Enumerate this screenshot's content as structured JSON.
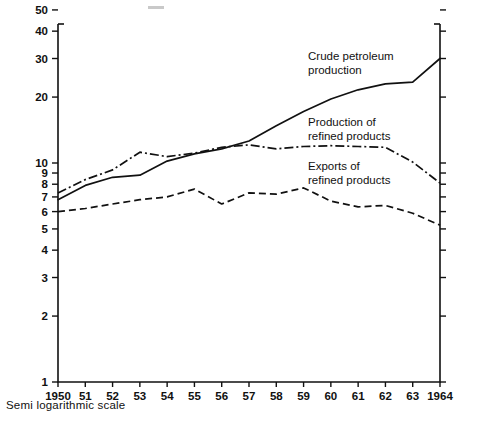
{
  "caption": "Semi logarithmic scale",
  "annotations": [
    {
      "id": "crude",
      "line1": "Crude petroleum",
      "line2": "production"
    },
    {
      "id": "production-refined",
      "line1": "Production of",
      "line2": "refined products"
    },
    {
      "id": "exports-refined",
      "line1": "Exports of",
      "line2": "refined products"
    }
  ],
  "axis": {
    "y_ticks": [
      "50",
      "40",
      "30",
      "20",
      "10",
      "9",
      "8",
      "7",
      "6",
      "5",
      "4",
      "3",
      "2",
      "1"
    ],
    "x_ticks": [
      "1950",
      "51",
      "52",
      "53",
      "54",
      "55",
      "56",
      "57",
      "58",
      "59",
      "60",
      "61",
      "62",
      "63",
      "1964"
    ],
    "scale": "log"
  },
  "chart_data": {
    "type": "line",
    "title": "",
    "subtitle": "",
    "xlabel": "",
    "ylabel": "",
    "yscale": "log",
    "ylim": [
      1,
      55
    ],
    "grid": false,
    "legend": "inline-annotations",
    "x": [
      1950,
      1951,
      1952,
      1953,
      1954,
      1955,
      1956,
      1957,
      1958,
      1959,
      1960,
      1961,
      1962,
      1963,
      1964
    ],
    "xticklabels": [
      "1950",
      "51",
      "52",
      "53",
      "54",
      "55",
      "56",
      "57",
      "58",
      "59",
      "60",
      "61",
      "62",
      "63",
      "1964"
    ],
    "series": [
      {
        "name": "Crude petroleum production",
        "style": "solid",
        "values": [
          6.8,
          7.9,
          8.6,
          8.8,
          10.2,
          11.0,
          11.6,
          12.6,
          14.8,
          17.2,
          19.6,
          21.6,
          23.0,
          23.4,
          30.0
        ]
      },
      {
        "name": "Production of refined products",
        "style": "dash-dot",
        "values": [
          7.3,
          8.4,
          9.3,
          11.2,
          10.7,
          11.1,
          11.8,
          12.1,
          11.6,
          11.9,
          12.0,
          11.9,
          11.8,
          10.1,
          8.1
        ]
      },
      {
        "name": "Exports of refined products",
        "style": "dashed",
        "values": [
          6.0,
          6.2,
          6.5,
          6.8,
          7.0,
          7.6,
          6.5,
          7.3,
          7.2,
          7.7,
          6.7,
          6.3,
          6.4,
          5.9,
          5.2
        ]
      }
    ]
  }
}
